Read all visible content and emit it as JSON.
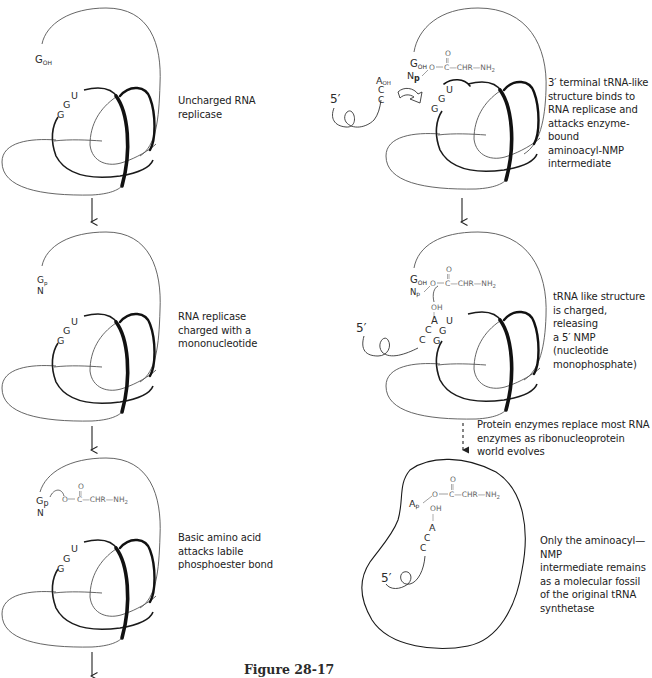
{
  "figure": {
    "label": "Figure 28-17",
    "panels": [
      {
        "id": "left-1",
        "caption": [
          "Uncharged RNA",
          "replicase"
        ],
        "labels": {
          "terminal": "G",
          "terminal_sub": "OH",
          "bases": [
            "G",
            "G",
            "U"
          ]
        }
      },
      {
        "id": "left-2",
        "caption": [
          "RNA replicase",
          "charged with a",
          "mononucleotide"
        ],
        "labels": {
          "terminal": "G",
          "terminal_sub": "p",
          "nucleotide": "N",
          "bases": [
            "G",
            "G",
            "U"
          ]
        }
      },
      {
        "id": "left-3",
        "caption": [
          "Basic amino acid",
          "attacks labile",
          "phosphoester bond"
        ],
        "labels": {
          "terminal": "G",
          "terminal_sub": "p",
          "nucleotide": "N",
          "chem_o": "O",
          "chem_carbonyl_o": "O",
          "chem_chain": "C—CHR—NH",
          "chem_sub": "2",
          "bases": [
            "G",
            "G",
            "U"
          ]
        }
      },
      {
        "id": "right-1",
        "caption": [
          "3′ terminal tRNA-like",
          "structure binds to",
          "RNA replicase and",
          "attacks enzyme-bound",
          "aminoacyl-NMP",
          "intermediate"
        ],
        "labels": {
          "five_prime": "5′",
          "terminal": "G",
          "terminal_sub": "OH",
          "np": "N",
          "np_sub": "p",
          "chem_o": "O",
          "chem_carbonyl_o": "O",
          "chem_chain": "C—CHR—NH",
          "chem_sub": "2",
          "a_oh": "A",
          "a_oh_sub": "OH",
          "trna_bases": [
            "C",
            "C"
          ],
          "bases": [
            "G",
            "G",
            "U"
          ]
        }
      },
      {
        "id": "right-2",
        "caption": [
          "tRNA like structure",
          "is charged, releasing",
          "a 5′ NMP (nucleotide",
          "monophosphate)"
        ],
        "labels": {
          "five_prime": "5′",
          "terminal": "G",
          "terminal_sub": "OH",
          "np": "N",
          "np_sub": "p",
          "chem_o": "O",
          "chem_carbonyl_o": "O",
          "chem_chain": "C—CHR—NH",
          "chem_sub": "2",
          "oh": "OH",
          "trna_bases": [
            "C",
            "C",
            "A"
          ],
          "bases": [
            "G",
            "G",
            "U"
          ]
        }
      },
      {
        "id": "right-transition",
        "caption": [
          "Protein enzymes replace most RNA",
          "enzymes as ribonucleoprotein",
          "world evolves"
        ]
      },
      {
        "id": "right-3",
        "caption": [
          "Only the aminoacyl—NMP",
          "intermediate remains",
          "as a molecular fossil",
          "of the original tRNA",
          "synthetase"
        ],
        "labels": {
          "five_prime": "5′",
          "ap": "A",
          "ap_sub": "p",
          "chem_o": "O",
          "chem_carbonyl_o": "O",
          "chem_chain": "C—CHR—NH",
          "chem_sub": "2",
          "oh": "OH",
          "trna_bases": [
            "C",
            "C",
            "A"
          ]
        }
      }
    ],
    "arrows": [
      {
        "from": "left-1",
        "to": "left-2",
        "style": "solid"
      },
      {
        "from": "left-2",
        "to": "left-3",
        "style": "solid"
      },
      {
        "from": "left-3",
        "to": "next",
        "style": "solid"
      },
      {
        "from": "right-1",
        "to": "right-2",
        "style": "solid"
      },
      {
        "from": "right-2",
        "to": "right-3",
        "style": "dashed"
      }
    ]
  }
}
